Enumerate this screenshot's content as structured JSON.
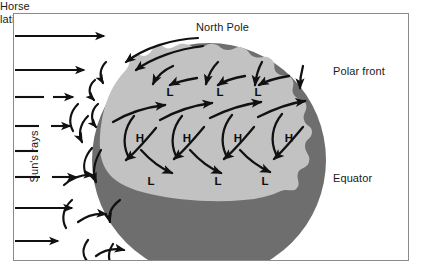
{
  "figure": {
    "frame": {
      "stroke": "#8a8a8a"
    },
    "colors": {
      "dark_shade": "#6e6e6e",
      "light_shade": "#c2c2c2",
      "arrow": "#111111",
      "text": "#1a1a1a",
      "background": "#ffffff"
    }
  },
  "labels": {
    "north_pole": "North Pole",
    "polar_front": "Polar front",
    "horse_latitudes_line1": "Horse",
    "horse_latitudes_line2": "latitudes",
    "equator": "Equator",
    "suns_rays": "Sun's rays"
  },
  "pressure_cells": {
    "upper_lows": [
      {
        "label": "L",
        "x": 170,
        "y": 92
      },
      {
        "label": "L",
        "x": 220,
        "y": 92
      },
      {
        "label": "L",
        "x": 258,
        "y": 92
      }
    ],
    "highs": [
      {
        "label": "H",
        "x": 140,
        "y": 138
      },
      {
        "label": "H",
        "x": 187,
        "y": 138
      },
      {
        "label": "H",
        "x": 238,
        "y": 138
      },
      {
        "label": "H",
        "x": 289,
        "y": 138
      }
    ],
    "lower_lows": [
      {
        "label": "L",
        "x": 151,
        "y": 181
      },
      {
        "label": "L",
        "x": 218,
        "y": 181
      },
      {
        "label": "L",
        "x": 265,
        "y": 181
      }
    ]
  },
  "suns_rays": {
    "count": 8,
    "rays": [
      {
        "y": 36,
        "x1": 15,
        "x2": 108
      },
      {
        "y": 70,
        "x1": 15,
        "x2": 88
      },
      {
        "y": 97,
        "x1": 15,
        "x2": 45
      },
      {
        "y": 97,
        "x1": 52,
        "x2": 75
      },
      {
        "y": 125,
        "x1": 15,
        "x2": 40
      },
      {
        "y": 125,
        "x1": 50,
        "x2": 72
      },
      {
        "y": 150,
        "x1": 15,
        "x2": 38
      },
      {
        "y": 176,
        "x1": 15,
        "x2": 40
      },
      {
        "y": 176,
        "x1": 52,
        "x2": 78
      },
      {
        "y": 207,
        "x1": 15,
        "x2": 75
      },
      {
        "y": 240,
        "x1": 15,
        "x2": 62
      }
    ]
  },
  "globe": {
    "center_x": 209,
    "center_y": 160,
    "radius": 117,
    "terminator_note": "wavy light band over dark sphere"
  }
}
